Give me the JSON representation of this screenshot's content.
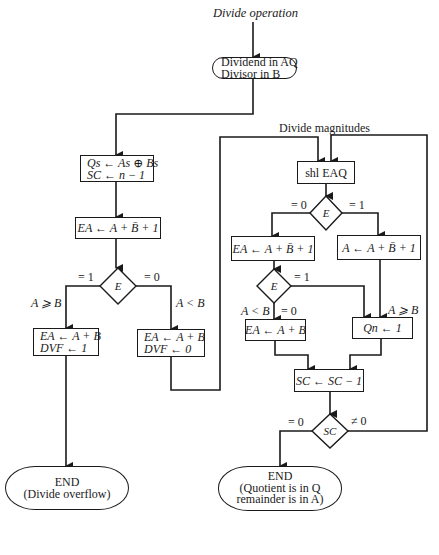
{
  "title": "Divide operation",
  "start": {
    "line1": "Dividend in AQ",
    "line2": "Divisor in B"
  },
  "sign_box": {
    "line1": "Qs ← As ⊕ Bs",
    "line2": "SC ← n − 1"
  },
  "overflow_check_box": "EA ← A + B̄ + 1",
  "overflow_decision": {
    "label": "E",
    "branch_left": "= 1",
    "branch_right": "= 0",
    "cond_left": "A ⩾ B",
    "cond_right": "A < B"
  },
  "overflow_box": {
    "line1": "EA ← A + B",
    "line2": "DVF ← 1"
  },
  "no_overflow_box": {
    "line1": "EA ← A + B",
    "line2": "DVF ← 0"
  },
  "end_overflow": {
    "line1": "END",
    "line2": "(Divide overflow)"
  },
  "magnitudes_label": "Divide magnitudes",
  "shift_box": "shl EAQ",
  "shift_decision": {
    "label": "E",
    "branch_left": "= 0",
    "branch_right": "= 1"
  },
  "sub_left_box": "EA ← A + B̄ + 1",
  "sub_right_box": "A ← A + B̄ + 1",
  "sub_decision": {
    "label": "E",
    "branch_right": "= 1",
    "branch_down": "= 0",
    "cond_down": "A < B",
    "cond_right": "A ⩾ B"
  },
  "restore_box": "EA ← A + B",
  "quotient_box": "Qn ← 1",
  "counter_box": "SC ← SC − 1",
  "counter_decision": {
    "label": "SC",
    "branch_left": "= 0",
    "branch_right": "≠ 0"
  },
  "end_result": {
    "line1": "END",
    "line2": "(Quotient is in Q",
    "line3": "remainder is in A)"
  }
}
